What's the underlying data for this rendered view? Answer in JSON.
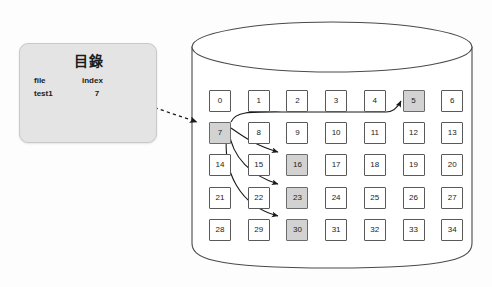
{
  "diagram": {
    "title_semantic": "file-index-to-disk-blocks-diagram",
    "background_color": "#fdfdfd"
  },
  "directory_card": {
    "title": "目錄",
    "columns": [
      "file",
      "index"
    ],
    "rows": [
      {
        "file": "test1",
        "index": "7"
      }
    ],
    "fill_color": "#e4e4e4",
    "border_color": "#c9c9c9"
  },
  "disk": {
    "label_semantic": "disk-cylinder",
    "outline_color": "#4a4a4a",
    "fill_color": "#ffffff"
  },
  "chart_data": {
    "type": "table",
    "rows": 5,
    "cols": 7,
    "cells": [
      {
        "value": "0",
        "row": 0,
        "col": 0,
        "shaded": false
      },
      {
        "value": "1",
        "row": 0,
        "col": 1,
        "shaded": false
      },
      {
        "value": "2",
        "row": 0,
        "col": 2,
        "shaded": false
      },
      {
        "value": "3",
        "row": 0,
        "col": 3,
        "shaded": false
      },
      {
        "value": "4",
        "row": 0,
        "col": 4,
        "shaded": false
      },
      {
        "value": "5",
        "row": 0,
        "col": 5,
        "shaded": true
      },
      {
        "value": "6",
        "row": 0,
        "col": 6,
        "shaded": false
      },
      {
        "value": "7",
        "row": 1,
        "col": 0,
        "shaded": true
      },
      {
        "value": "8",
        "row": 1,
        "col": 1,
        "shaded": false
      },
      {
        "value": "9",
        "row": 1,
        "col": 2,
        "shaded": false
      },
      {
        "value": "10",
        "row": 1,
        "col": 3,
        "shaded": false
      },
      {
        "value": "11",
        "row": 1,
        "col": 4,
        "shaded": false
      },
      {
        "value": "12",
        "row": 1,
        "col": 5,
        "shaded": false
      },
      {
        "value": "13",
        "row": 1,
        "col": 6,
        "shaded": false
      },
      {
        "value": "14",
        "row": 2,
        "col": 0,
        "shaded": false
      },
      {
        "value": "15",
        "row": 2,
        "col": 1,
        "shaded": false
      },
      {
        "value": "16",
        "row": 2,
        "col": 2,
        "shaded": true
      },
      {
        "value": "17",
        "row": 2,
        "col": 3,
        "shaded": false
      },
      {
        "value": "18",
        "row": 2,
        "col": 4,
        "shaded": false
      },
      {
        "value": "19",
        "row": 2,
        "col": 5,
        "shaded": false
      },
      {
        "value": "20",
        "row": 2,
        "col": 6,
        "shaded": false
      },
      {
        "value": "21",
        "row": 3,
        "col": 0,
        "shaded": false
      },
      {
        "value": "22",
        "row": 3,
        "col": 1,
        "shaded": false
      },
      {
        "value": "23",
        "row": 3,
        "col": 2,
        "shaded": true
      },
      {
        "value": "24",
        "row": 3,
        "col": 3,
        "shaded": false
      },
      {
        "value": "25",
        "row": 3,
        "col": 4,
        "shaded": false
      },
      {
        "value": "26",
        "row": 3,
        "col": 5,
        "shaded": false
      },
      {
        "value": "27",
        "row": 3,
        "col": 6,
        "shaded": false
      },
      {
        "value": "28",
        "row": 4,
        "col": 0,
        "shaded": false
      },
      {
        "value": "29",
        "row": 4,
        "col": 1,
        "shaded": false
      },
      {
        "value": "30",
        "row": 4,
        "col": 2,
        "shaded": true
      },
      {
        "value": "31",
        "row": 4,
        "col": 3,
        "shaded": false
      },
      {
        "value": "32",
        "row": 4,
        "col": 4,
        "shaded": false
      },
      {
        "value": "33",
        "row": 4,
        "col": 5,
        "shaded": false
      },
      {
        "value": "34",
        "row": 4,
        "col": 6,
        "shaded": false
      }
    ],
    "highlighted": [
      "5",
      "7",
      "16",
      "23",
      "30"
    ],
    "index_block": "7",
    "data_blocks": [
      "5",
      "16",
      "23",
      "30"
    ],
    "connections": [
      {
        "from": "directory.index",
        "to": "7",
        "style": "dashed"
      },
      {
        "from": "7",
        "to": "5",
        "style": "solid"
      },
      {
        "from": "7",
        "to": "16",
        "style": "solid"
      },
      {
        "from": "7",
        "to": "23",
        "style": "solid"
      },
      {
        "from": "7",
        "to": "30",
        "style": "solid"
      }
    ]
  },
  "style": {
    "cell_fill": "#ffffff",
    "cell_shaded_fill": "#d2d2d2",
    "cell_border": "#595959",
    "arrow_color": "#1a1a1a"
  }
}
